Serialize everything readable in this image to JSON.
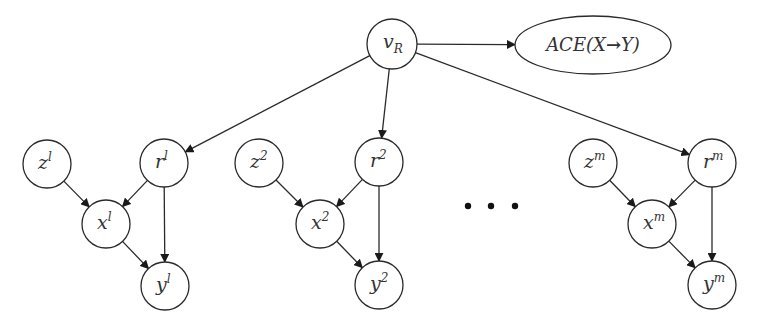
{
  "diagram": {
    "type": "causal-graph",
    "root": {
      "id": "vR",
      "main": "v",
      "sub": "R",
      "cx": 392,
      "cy": 44,
      "r": 25
    },
    "outcome": {
      "id": "ace",
      "prefix": "ACE(X",
      "arrow": "→",
      "suffix": "Y)",
      "cx": 593,
      "cy": 45,
      "rx": 78,
      "ry": 29
    },
    "groups": [
      {
        "index": "l",
        "nodes": {
          "z": {
            "main": "z",
            "sup": "l",
            "cx": 47,
            "cy": 164
          },
          "r": {
            "main": "r",
            "sup": "l",
            "cx": 164,
            "cy": 163
          },
          "x": {
            "main": "x",
            "sup": "l",
            "cx": 106,
            "cy": 224
          },
          "y": {
            "main": "y",
            "sup": "l",
            "cx": 165,
            "cy": 286
          }
        }
      },
      {
        "index": "2",
        "nodes": {
          "z": {
            "main": "z",
            "sup": "2",
            "cx": 259,
            "cy": 163
          },
          "r": {
            "main": "r",
            "sup": "2",
            "cx": 379,
            "cy": 162
          },
          "x": {
            "main": "x",
            "sup": "2",
            "cx": 320,
            "cy": 224
          },
          "y": {
            "main": "y",
            "sup": "2",
            "cx": 379,
            "cy": 285
          }
        }
      },
      {
        "index": "m",
        "nodes": {
          "z": {
            "main": "z",
            "sup": "m",
            "cx": 593,
            "cy": 163
          },
          "r": {
            "main": "r",
            "sup": "m",
            "cx": 712,
            "cy": 163
          },
          "x": {
            "main": "x",
            "sup": "m",
            "cx": 652,
            "cy": 224
          },
          "y": {
            "main": "y",
            "sup": "m",
            "cx": 712,
            "cy": 285
          }
        }
      }
    ],
    "node_radius": 24,
    "edges": [
      {
        "from": "vR",
        "to": "ace"
      },
      {
        "from": "vR",
        "to": "r^l"
      },
      {
        "from": "vR",
        "to": "r^2"
      },
      {
        "from": "vR",
        "to": "r^m"
      },
      {
        "from": "z^l",
        "to": "x^l"
      },
      {
        "from": "r^l",
        "to": "x^l"
      },
      {
        "from": "r^l",
        "to": "y^l"
      },
      {
        "from": "x^l",
        "to": "y^l"
      },
      {
        "from": "z^2",
        "to": "x^2"
      },
      {
        "from": "r^2",
        "to": "x^2"
      },
      {
        "from": "r^2",
        "to": "y^2"
      },
      {
        "from": "x^2",
        "to": "y^2"
      },
      {
        "from": "z^m",
        "to": "x^m"
      },
      {
        "from": "r^m",
        "to": "x^m"
      },
      {
        "from": "r^m",
        "to": "y^m"
      },
      {
        "from": "x^m",
        "to": "y^m"
      }
    ],
    "ellipsis": {
      "symbol": "• • •",
      "dots": [
        [
          468,
          206
        ],
        [
          491,
          206
        ],
        [
          515,
          206
        ]
      ]
    }
  }
}
